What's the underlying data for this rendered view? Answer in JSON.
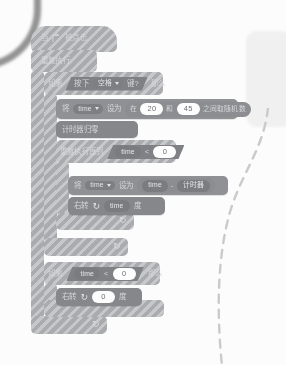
{
  "app": {
    "title": "Scratch 积木脚本",
    "language": "zh-CN",
    "state": "disabled-hatched"
  },
  "colors": {
    "block_body": "#a9abae",
    "stack_block": "#8f9195",
    "input_oval": "#fdfdfd",
    "reporter": "#7a7c80",
    "canvas": "#fcfcfc",
    "text": "#d5d6d8"
  },
  "script": {
    "hat": {
      "label_before": "当",
      "icon": "green-flag-icon",
      "label_after": "被点击"
    },
    "forever": {
      "label": "重复执行"
    },
    "if_key": {
      "keyword": "如果",
      "condition": {
        "prefix": "按下",
        "key": "空格",
        "suffix": "键?"
      },
      "then": "那么"
    },
    "set_time_random": {
      "keyword": "将",
      "variable": "time",
      "setto": "设为",
      "random": {
        "prefix": "在",
        "from": "20",
        "middle": "和",
        "to": "45",
        "suffix": "之间取随机数"
      }
    },
    "reset_timer": {
      "label": "计时器归零"
    },
    "repeat_until": {
      "keyword": "重复执行直到",
      "condition": {
        "left": "time",
        "operator": "<",
        "right": "0"
      }
    },
    "set_time_minus": {
      "keyword": "将",
      "variable": "time",
      "setto": "设为",
      "expression": {
        "left": "time",
        "operator": "-",
        "right": "计时器"
      }
    },
    "turn_right_time": {
      "keyword": "右转",
      "icon": "turn-right-icon",
      "value": "time",
      "unit": "度"
    },
    "if_time": {
      "keyword": "如果",
      "condition": {
        "left": "time",
        "operator": "<",
        "right": "0"
      },
      "then": "那么"
    },
    "turn_right_zero": {
      "keyword": "右转",
      "icon": "turn-right-icon",
      "value": "0",
      "unit": "度"
    },
    "loop_arrow_glyph": "↻"
  }
}
